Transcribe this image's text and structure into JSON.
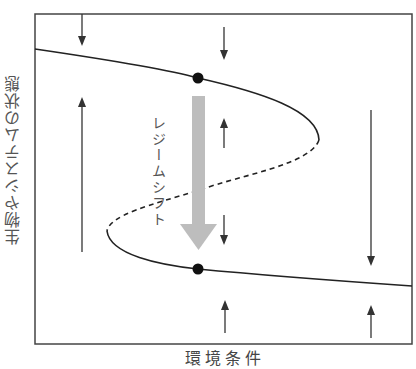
{
  "diagram": {
    "y_axis_label": "生物やシステムの状態",
    "x_axis_label": "環境条件",
    "annotation": "レジームシフト",
    "colors": {
      "frame": "#333333",
      "curve": "#222222",
      "shift_arrow": "#bdbdbd",
      "equilibrium_dot": "#111111",
      "arrows": "#333333"
    },
    "elements": {
      "upper_stable_branch": "solid curve from left edge to right fold point",
      "unstable_branch": "dashed curve between fold points",
      "lower_stable_branch": "solid curve from left fold point to right edge",
      "equilibrium_points": [
        {
          "name": "upper-equilibrium",
          "x": 198,
          "y": 78
        },
        {
          "name": "lower-equilibrium",
          "x": 198,
          "y": 269
        }
      ],
      "direction_arrows": [
        {
          "x": 82,
          "direction": "down",
          "from": 14,
          "to": 46
        },
        {
          "x": 82,
          "direction": "up",
          "from": 252,
          "to": 97
        },
        {
          "x": 224,
          "direction": "down",
          "from": 27,
          "to": 60
        },
        {
          "x": 224,
          "direction": "up",
          "from": 148,
          "to": 118
        },
        {
          "x": 224,
          "direction": "down",
          "from": 215,
          "to": 245
        },
        {
          "x": 224,
          "direction": "up",
          "from": 333,
          "to": 300
        },
        {
          "x": 371,
          "direction": "down",
          "from": 110,
          "to": 266
        },
        {
          "x": 371,
          "direction": "up",
          "from": 338,
          "to": 305
        }
      ]
    }
  }
}
